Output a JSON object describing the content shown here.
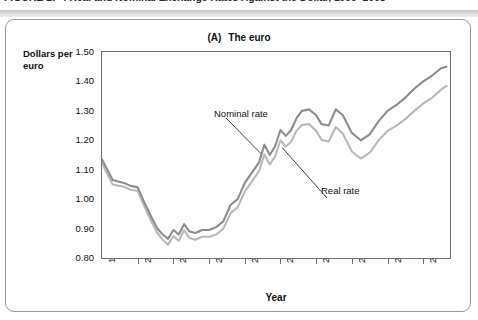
{
  "figure": {
    "caption": "FIGURE 17-4   Real and Nominal Exchange Rates Against the Dollar, 1999–2008"
  },
  "chart_data": {
    "type": "line",
    "title_prefix": "(A)",
    "title": "The euro",
    "xlabel": "Year",
    "ylabel": "Dollars per euro",
    "ylabel_line1": "Dollars per",
    "ylabel_line2": "euro",
    "grid": false,
    "legend": "annotations-inline",
    "xlim": [
      1999,
      2008.75
    ],
    "ylim": [
      0.8,
      1.5
    ],
    "yticks": [
      "1.50",
      "1.40",
      "1.30",
      "1.20",
      "1.10",
      "1.00",
      "0.90",
      "0.80"
    ],
    "ytick_values": [
      1.5,
      1.4,
      1.3,
      1.2,
      1.1,
      1.0,
      0.9,
      0.8
    ],
    "xticks": [
      "1999",
      "2000",
      "2001",
      "2002",
      "2003",
      "2004",
      "2005",
      "2006",
      "2007",
      "2008"
    ],
    "xtick_values": [
      1999,
      2000,
      2001,
      2002,
      2003,
      2004,
      2005,
      2006,
      2007,
      2008
    ],
    "annotations": [
      {
        "label": "Nominal rate",
        "series": "Nominal rate",
        "points_to_x": 2003.45,
        "points_to_y": 1.155
      },
      {
        "label": "Real rate",
        "series": "Real rate",
        "points_to_x": 2004.05,
        "points_to_y": 1.175
      }
    ],
    "series": [
      {
        "name": "Nominal rate",
        "color": "#8d8d8d",
        "x": [
          1999.0,
          1999.15,
          1999.3,
          1999.45,
          1999.62,
          1999.8,
          2000.0,
          2000.2,
          2000.4,
          2000.55,
          2000.7,
          2000.85,
          2001.0,
          2001.15,
          2001.3,
          2001.45,
          2001.62,
          2001.8,
          2002.0,
          2002.2,
          2002.4,
          2002.6,
          2002.8,
          2003.0,
          2003.2,
          2003.4,
          2003.55,
          2003.7,
          2003.85,
          2004.0,
          2004.15,
          2004.3,
          2004.45,
          2004.6,
          2004.8,
          2005.0,
          2005.15,
          2005.35,
          2005.55,
          2005.75,
          2006.0,
          2006.25,
          2006.5,
          2006.75,
          2007.0,
          2007.25,
          2007.5,
          2007.75,
          2008.0,
          2008.25,
          2008.5,
          2008.65
        ],
        "y": [
          1.135,
          1.1,
          1.065,
          1.06,
          1.055,
          1.045,
          1.04,
          0.985,
          0.935,
          0.9,
          0.88,
          0.865,
          0.895,
          0.88,
          0.915,
          0.89,
          0.885,
          0.895,
          0.895,
          0.905,
          0.925,
          0.98,
          1.0,
          1.055,
          1.09,
          1.125,
          1.185,
          1.15,
          1.18,
          1.235,
          1.215,
          1.235,
          1.275,
          1.3,
          1.305,
          1.285,
          1.255,
          1.25,
          1.305,
          1.285,
          1.225,
          1.2,
          1.22,
          1.265,
          1.3,
          1.32,
          1.345,
          1.375,
          1.4,
          1.42,
          1.445,
          1.45
        ]
      },
      {
        "name": "Real rate",
        "color": "#b9b9b9",
        "x": [
          1999.0,
          1999.15,
          1999.3,
          1999.45,
          1999.62,
          1999.8,
          2000.0,
          2000.2,
          2000.4,
          2000.55,
          2000.7,
          2000.85,
          2001.0,
          2001.15,
          2001.3,
          2001.45,
          2001.62,
          2001.8,
          2002.0,
          2002.2,
          2002.4,
          2002.6,
          2002.8,
          2003.0,
          2003.2,
          2003.4,
          2003.55,
          2003.7,
          2003.85,
          2004.0,
          2004.15,
          2004.3,
          2004.45,
          2004.6,
          2004.8,
          2005.0,
          2005.15,
          2005.35,
          2005.55,
          2005.75,
          2006.0,
          2006.25,
          2006.5,
          2006.75,
          2007.0,
          2007.25,
          2007.5,
          2007.75,
          2008.0,
          2008.25,
          2008.5,
          2008.65
        ],
        "y": [
          1.12,
          1.085,
          1.05,
          1.046,
          1.042,
          1.032,
          1.028,
          0.972,
          0.92,
          0.885,
          0.862,
          0.845,
          0.875,
          0.858,
          0.895,
          0.868,
          0.862,
          0.872,
          0.872,
          0.88,
          0.9,
          0.952,
          0.972,
          1.026,
          1.06,
          1.095,
          1.152,
          1.118,
          1.145,
          1.2,
          1.178,
          1.196,
          1.232,
          1.252,
          1.255,
          1.232,
          1.202,
          1.196,
          1.245,
          1.222,
          1.162,
          1.138,
          1.158,
          1.2,
          1.232,
          1.25,
          1.272,
          1.3,
          1.325,
          1.345,
          1.372,
          1.385
        ]
      }
    ]
  }
}
